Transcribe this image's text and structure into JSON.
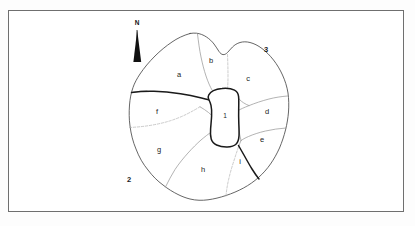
{
  "figure": {
    "kind": "hand-drawn sketch map",
    "background_color": "#ffffff",
    "frame_color": "#6f6f6f"
  },
  "compass": {
    "letter": "N",
    "icon": "north-arrow-icon",
    "color": "#111111"
  },
  "regions": [
    {
      "id": "a",
      "label": "a",
      "cx": 179,
      "cy": 75
    },
    {
      "id": "b",
      "label": "b",
      "cx": 211,
      "cy": 61
    },
    {
      "id": "c",
      "label": "c",
      "cx": 248,
      "cy": 79
    },
    {
      "id": "d",
      "label": "d",
      "cx": 267,
      "cy": 112
    },
    {
      "id": "e",
      "label": "e",
      "cx": 262,
      "cy": 140
    },
    {
      "id": "f",
      "label": "f",
      "cx": 157,
      "cy": 112
    },
    {
      "id": "g",
      "label": "g",
      "cx": 159,
      "cy": 150
    },
    {
      "id": "h",
      "label": "h",
      "cx": 203,
      "cy": 170
    },
    {
      "id": "i",
      "label": "i",
      "cx": 240,
      "cy": 162
    }
  ],
  "core": {
    "id": "1",
    "label": "1",
    "cx": 225,
    "cy": 116,
    "outline_color": "#1a1a1a"
  },
  "outer_markers": [
    {
      "id": "2",
      "label": "2",
      "cx": 129,
      "cy": 180
    },
    {
      "id": "3",
      "label": "3",
      "cx": 266,
      "cy": 50
    }
  ]
}
